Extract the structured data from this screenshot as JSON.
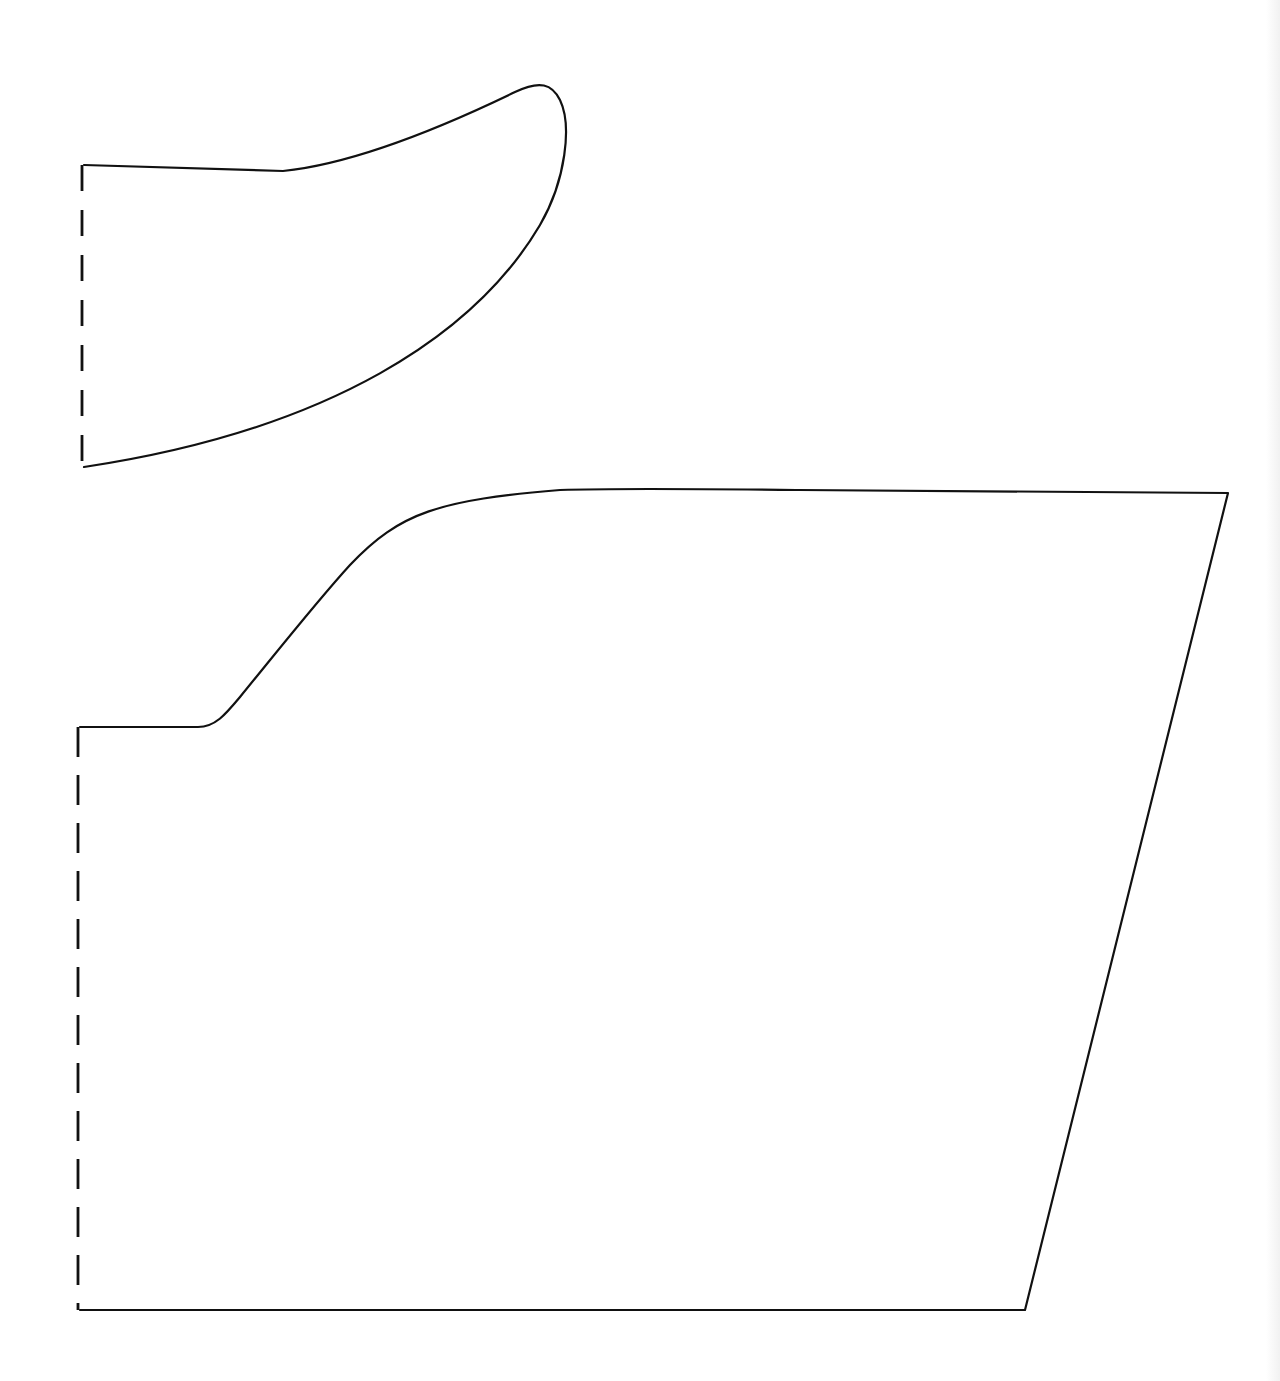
{
  "diagram": {
    "type": "sewing-pattern",
    "background": "#ffffff",
    "stroke_color": "#111111",
    "stroke_width": 2.2,
    "pieces": [
      {
        "id": "upper-piece",
        "label": "",
        "outline_path": "M 84 165 L 283 171 C 340 165 420 138 515 92 C 540 80 552 84 560 100 C 572 125 566 180 540 225 C 475 335 330 430 84 467",
        "fold_line": {
          "x": 82,
          "y1": 165,
          "y2": 467,
          "dash": "26 19"
        }
      },
      {
        "id": "lower-piece",
        "label": "",
        "outline_path": "M 80 727 L 198 727 C 215 727 225 715 240 697 C 280 648 318 600 350 565 C 400 512 440 500 560 490 C 620 488 700 489 800 490 L 1228 493 L 1025 1310 L 80 1310",
        "fold_line": {
          "x": 78,
          "y1": 727,
          "y2": 1310,
          "dash": "30 18"
        }
      }
    ]
  }
}
